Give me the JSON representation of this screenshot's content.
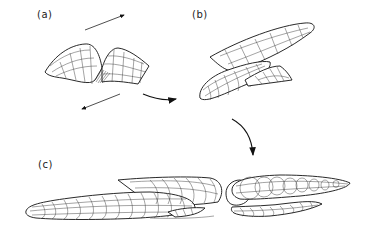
{
  "figure": {
    "panels": [
      {
        "id": "a",
        "label": "(a)",
        "description": "Folded wavy surface sheet with opposing shear arrows"
      },
      {
        "id": "b",
        "label": "(b)",
        "description": "Sheared fold stretched into elongated sheath form"
      },
      {
        "id": "c",
        "label": "(c)",
        "description": "Highly elongated sheath fold shown whole and cut into sections"
      }
    ],
    "arrows": [
      {
        "name": "shear-arrow-top",
        "direction": "up-right"
      },
      {
        "name": "shear-arrow-bottom",
        "direction": "down-left"
      },
      {
        "name": "transition-arrow-a-to-b",
        "direction": "right"
      },
      {
        "name": "transition-arrow-b-to-c",
        "direction": "down"
      }
    ],
    "colors": {
      "line": "#222222",
      "background": "#ffffff"
    }
  }
}
